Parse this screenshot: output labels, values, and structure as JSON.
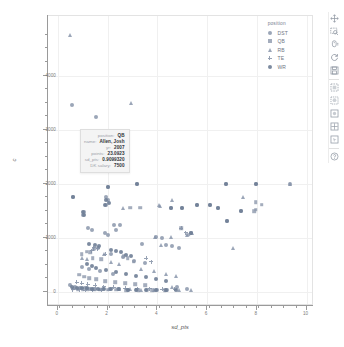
{
  "chart_data": {
    "type": "scatter",
    "title": "",
    "xlabel": "sd_pts",
    "ylabel": "c",
    "xlim": [
      -0.4,
      10.3
    ],
    "ylim": [
      -260,
      5100
    ],
    "xticks": [
      0,
      2,
      4,
      6,
      8,
      10
    ],
    "yticks": [
      0,
      1000,
      2000,
      3000,
      4000
    ],
    "xtick_labels": [
      "0",
      "2",
      "4",
      "6",
      "8",
      "10"
    ],
    "ytick_labels": [
      "0",
      "1000",
      "2000",
      "3000",
      "4000"
    ],
    "grid": true,
    "legend_title": "position",
    "legend_position": "top-right",
    "series": [
      {
        "name": "DST",
        "marker": "circle",
        "points": [
          [
            0.55,
            3450
          ],
          [
            1.55,
            3240
          ],
          [
            0.62,
            1760
          ],
          [
            1.05,
            1480
          ],
          [
            1.0,
            1420
          ],
          [
            1.92,
            1760
          ],
          [
            2.0,
            1700
          ],
          [
            1.95,
            1610
          ],
          [
            2.02,
            1945
          ],
          [
            3.2,
            1995
          ],
          [
            4.55,
            1560
          ],
          [
            5.0,
            1555
          ],
          [
            5.6,
            1600
          ],
          [
            6.1,
            1600
          ],
          [
            6.75,
            1995
          ],
          [
            6.45,
            1560
          ],
          [
            7.35,
            1490
          ],
          [
            7.95,
            1995
          ],
          [
            6.8,
            1305
          ],
          [
            5.35,
            1090
          ],
          [
            9.35,
            1995
          ],
          [
            1.2,
            1180
          ],
          [
            1.35,
            1140
          ],
          [
            2.25,
            1230
          ],
          [
            2.5,
            1235
          ],
          [
            2.35,
            1140
          ],
          [
            1.9,
            1095
          ],
          [
            2.0,
            1060
          ],
          [
            3.95,
            1020
          ],
          [
            4.2,
            990
          ],
          [
            3.4,
            880
          ],
          [
            4.35,
            870
          ],
          [
            4.6,
            845
          ],
          [
            4.85,
            820
          ],
          [
            1.45,
            790
          ],
          [
            1.6,
            820
          ],
          [
            2.15,
            700
          ],
          [
            2.6,
            640
          ],
          [
            3.05,
            580
          ],
          [
            3.5,
            540
          ],
          [
            0.95,
            460
          ],
          [
            1.25,
            420
          ],
          [
            1.7,
            380
          ],
          [
            2.2,
            340
          ],
          [
            0.5,
            120
          ],
          [
            0.7,
            95
          ],
          [
            0.9,
            80
          ],
          [
            1.1,
            70
          ],
          [
            1.3,
            60
          ],
          [
            1.5,
            55
          ],
          [
            1.8,
            50
          ],
          [
            2.1,
            48
          ],
          [
            2.4,
            45
          ],
          [
            2.8,
            42
          ],
          [
            3.2,
            40
          ],
          [
            3.6,
            38
          ],
          [
            4.0,
            36
          ],
          [
            4.4,
            34
          ],
          [
            4.8,
            95
          ],
          [
            5.2,
            60
          ]
        ]
      },
      {
        "name": "QB",
        "marker": "square",
        "points": [
          [
            1.05,
            2340
          ],
          [
            1.02,
            2335
          ],
          [
            2.9,
            1555
          ],
          [
            3.3,
            1560
          ],
          [
            7.95,
            1660
          ],
          [
            8.2,
            1610
          ],
          [
            7.95,
            1520
          ],
          [
            7.9,
            1490
          ],
          [
            4.95,
            1180
          ],
          [
            5.25,
            1060
          ],
          [
            1.15,
            740
          ],
          [
            1.3,
            735
          ],
          [
            0.95,
            700
          ],
          [
            1.4,
            620
          ],
          [
            1.75,
            600
          ],
          [
            2.65,
            660
          ],
          [
            2.8,
            620
          ],
          [
            3.05,
            560
          ],
          [
            0.85,
            320
          ],
          [
            1.05,
            280
          ],
          [
            1.25,
            250
          ],
          [
            1.55,
            230
          ],
          [
            1.9,
            200
          ],
          [
            2.3,
            180
          ],
          [
            2.7,
            160
          ],
          [
            3.1,
            140
          ],
          [
            3.5,
            120
          ],
          [
            0.6,
            60
          ],
          [
            0.8,
            55
          ],
          [
            1.0,
            50
          ],
          [
            1.2,
            48
          ],
          [
            1.45,
            45
          ],
          [
            1.7,
            42
          ],
          [
            2.0,
            40
          ],
          [
            2.35,
            38
          ],
          [
            2.75,
            36
          ],
          [
            3.25,
            34
          ],
          [
            3.8,
            32
          ],
          [
            4.3,
            30
          ]
        ]
      },
      {
        "name": "RB",
        "marker": "triangle",
        "points": [
          [
            0.5,
            4750
          ],
          [
            2.95,
            3500
          ],
          [
            2.6,
            1560
          ],
          [
            4.05,
            1610
          ],
          [
            4.6,
            1700
          ],
          [
            4.1,
            1590
          ],
          [
            3.9,
            1020
          ],
          [
            4.15,
            870
          ],
          [
            4.55,
            1020
          ],
          [
            5.2,
            1060
          ],
          [
            5.4,
            1090
          ],
          [
            7.05,
            820
          ],
          [
            7.45,
            1755
          ],
          [
            9.35,
            1995
          ],
          [
            0.95,
            620
          ],
          [
            1.15,
            600
          ],
          [
            1.85,
            700
          ],
          [
            2.15,
            560
          ],
          [
            2.45,
            520
          ],
          [
            3.35,
            420
          ],
          [
            3.85,
            380
          ],
          [
            4.35,
            340
          ],
          [
            4.75,
            300
          ],
          [
            4.6,
            100
          ],
          [
            0.65,
            80
          ],
          [
            0.9,
            70
          ],
          [
            1.15,
            65
          ],
          [
            1.4,
            60
          ],
          [
            1.7,
            55
          ],
          [
            2.05,
            50
          ],
          [
            2.45,
            48
          ],
          [
            2.9,
            45
          ],
          [
            3.35,
            42
          ],
          [
            3.85,
            40
          ],
          [
            4.35,
            38
          ],
          [
            4.85,
            36
          ],
          [
            5.35,
            34
          ]
        ]
      },
      {
        "name": "TE",
        "marker": "plus",
        "points": [
          [
            1.45,
            820
          ],
          [
            1.6,
            800
          ],
          [
            1.35,
            760
          ],
          [
            1.9,
            700
          ],
          [
            4.95,
            1180
          ],
          [
            5.15,
            1090
          ],
          [
            3.55,
            620
          ],
          [
            3.75,
            560
          ],
          [
            0.75,
            180
          ],
          [
            0.95,
            160
          ],
          [
            1.2,
            140
          ],
          [
            1.5,
            120
          ],
          [
            1.85,
            100
          ],
          [
            2.25,
            85
          ],
          [
            2.7,
            70
          ],
          [
            3.2,
            60
          ],
          [
            3.7,
            55
          ],
          [
            4.2,
            50
          ],
          [
            4.7,
            45
          ],
          [
            0.6,
            38
          ],
          [
            0.85,
            36
          ],
          [
            1.1,
            34
          ],
          [
            1.4,
            32
          ],
          [
            1.75,
            30
          ]
        ]
      },
      {
        "name": "WR",
        "marker": "circle-solid",
        "points": [
          [
            2.0,
            1945
          ],
          [
            3.2,
            1995
          ],
          [
            6.75,
            1995
          ],
          [
            7.95,
            1995
          ],
          [
            1.95,
            1700
          ],
          [
            2.05,
            1640
          ],
          [
            1.9,
            1610
          ],
          [
            0.62,
            1760
          ],
          [
            1.0,
            1480
          ],
          [
            1.05,
            1420
          ],
          [
            5.6,
            1600
          ],
          [
            6.1,
            1600
          ],
          [
            6.45,
            1560
          ],
          [
            4.55,
            1560
          ],
          [
            5.0,
            1555
          ],
          [
            7.35,
            1490
          ],
          [
            6.8,
            1305
          ],
          [
            5.35,
            1090
          ],
          [
            1.25,
            880
          ],
          [
            1.5,
            860
          ],
          [
            1.65,
            840
          ],
          [
            2.15,
            780
          ],
          [
            2.35,
            760
          ],
          [
            2.55,
            740
          ],
          [
            2.75,
            690
          ],
          [
            2.95,
            660
          ],
          [
            1.15,
            520
          ],
          [
            1.35,
            480
          ],
          [
            1.55,
            440
          ],
          [
            1.95,
            400
          ],
          [
            2.35,
            360
          ],
          [
            2.75,
            330
          ],
          [
            3.15,
            300
          ],
          [
            3.55,
            270
          ],
          [
            3.95,
            240
          ],
          [
            4.35,
            210
          ],
          [
            0.55,
            90
          ],
          [
            0.75,
            80
          ],
          [
            0.95,
            72
          ],
          [
            1.15,
            66
          ],
          [
            1.35,
            60
          ],
          [
            1.6,
            56
          ],
          [
            1.85,
            52
          ],
          [
            2.15,
            48
          ],
          [
            2.45,
            45
          ],
          [
            2.8,
            42
          ],
          [
            3.15,
            40
          ],
          [
            3.55,
            38
          ],
          [
            3.95,
            36
          ],
          [
            4.35,
            34
          ],
          [
            4.75,
            32
          ]
        ]
      }
    ]
  },
  "legend": {
    "title": "position",
    "items": [
      {
        "label": "DST",
        "marker": "circle"
      },
      {
        "label": "QB",
        "marker": "square"
      },
      {
        "label": "RB",
        "marker": "triangle"
      },
      {
        "label": "TE",
        "marker": "plus"
      },
      {
        "label": "WR",
        "marker": "circle-solid"
      }
    ]
  },
  "tooltip": {
    "rows": [
      {
        "key": "position",
        "value": "QB"
      },
      {
        "key": "name",
        "value": "Allen, Josh"
      },
      {
        "key": "yr",
        "value": "2007"
      },
      {
        "key": "points",
        "value": "23.0923"
      },
      {
        "key": "sd_pts",
        "value": "0.9099320"
      },
      {
        "key": "DK salary",
        "value": "7500"
      }
    ]
  },
  "toolbar": {
    "tools": [
      {
        "name": "pan-tool",
        "icon": "move-icon"
      },
      {
        "name": "box-zoom-tool",
        "icon": "box-zoom-icon"
      },
      {
        "name": "wheel-zoom-tool",
        "icon": "wheel-zoom-icon"
      },
      {
        "name": "reset-tool",
        "icon": "reset-icon"
      },
      {
        "name": "save-tool",
        "icon": "save-icon"
      },
      {
        "name": "box-select-tool",
        "icon": "box-select-icon"
      },
      {
        "name": "lasso-select-tool",
        "icon": "lasso-icon"
      },
      {
        "name": "tap-tool",
        "icon": "tap-icon"
      },
      {
        "name": "crosshair-tool",
        "icon": "crosshair-icon"
      },
      {
        "name": "hover-tool",
        "icon": "hover-icon"
      },
      {
        "name": "help-tool",
        "icon": "help-icon"
      }
    ]
  },
  "colors": {
    "marker": "#8592a8",
    "grid": "#f0f0f0",
    "axis": "#9a9a9a",
    "tick_label": "#7a7a7a",
    "tooltip_bg": "#f4f4f4",
    "tooltip_border": "#dedede"
  }
}
